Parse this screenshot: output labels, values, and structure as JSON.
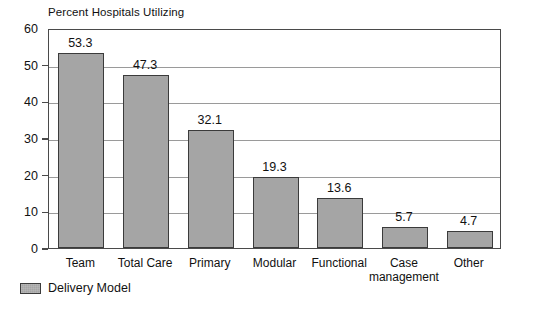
{
  "chart_data": {
    "type": "bar",
    "title": "Percent Hospitals Utilizing",
    "xlabel": "",
    "ylabel": "",
    "ylim": [
      0,
      60
    ],
    "yticks": [
      0,
      10,
      20,
      30,
      40,
      50,
      60
    ],
    "ytick_labels": [
      "0",
      "10",
      "20",
      "30",
      "40",
      "50",
      "60"
    ],
    "grid": true,
    "legend_position": "bottom-left",
    "categories": [
      "Team",
      "Total Care",
      "Primary",
      "Modular",
      "Functional",
      "Case management",
      "Other"
    ],
    "category_lines": [
      [
        "Team"
      ],
      [
        "Total Care"
      ],
      [
        "Primary"
      ],
      [
        "Modular"
      ],
      [
        "Functional"
      ],
      [
        "Case",
        "management"
      ],
      [
        "Other"
      ]
    ],
    "values": [
      53.3,
      47.3,
      32.1,
      19.3,
      13.6,
      5.7,
      4.7
    ],
    "value_labels": [
      "53.3",
      "47.3",
      "32.1",
      "19.3",
      "13.6",
      "5.7",
      "4.7"
    ],
    "series": [
      {
        "name": "Delivery Model",
        "values": [
          53.3,
          47.3,
          32.1,
          19.3,
          13.6,
          5.7,
          4.7
        ]
      }
    ],
    "legend": [
      "Delivery Model"
    ],
    "colors": {
      "bar_fill": "#a5a5a5",
      "bar_border": "#3b3b3b",
      "gridline": "#9a9a9a",
      "axis": "#4a4a4a",
      "text": "#111111",
      "background": "#ffffff"
    }
  }
}
